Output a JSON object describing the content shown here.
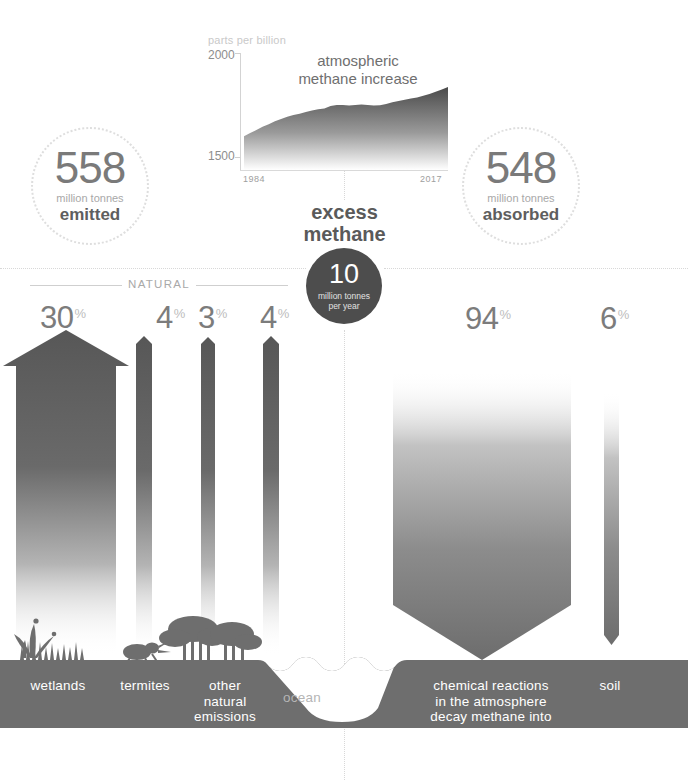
{
  "chart": {
    "units_label": "parts per billion",
    "title": "atmospheric\nmethane increase",
    "title_line1": "atmospheric",
    "title_line2": "methane increase",
    "y_top": "2000",
    "y_bottom": "1500",
    "x_start": "1984",
    "x_end": "2017"
  },
  "chart_data": {
    "type": "area",
    "title": "atmospheric methane increase",
    "xlabel": "",
    "ylabel": "parts per billion",
    "ylim": [
      1500,
      2000
    ],
    "xlim": [
      1984,
      2017
    ],
    "grid": false,
    "legend": "none",
    "x": [
      1984,
      1985,
      1986,
      1987,
      1988,
      1989,
      1990,
      1991,
      1992,
      1993,
      1994,
      1995,
      1996,
      1997,
      1998,
      1999,
      2000,
      2001,
      2002,
      2003,
      2004,
      2005,
      2006,
      2007,
      2008,
      2009,
      2010,
      2011,
      2012,
      2013,
      2014,
      2015,
      2016,
      2017
    ],
    "values": [
      1645,
      1660,
      1672,
      1686,
      1697,
      1710,
      1720,
      1730,
      1737,
      1742,
      1750,
      1757,
      1762,
      1765,
      1776,
      1780,
      1780,
      1778,
      1780,
      1782,
      1780,
      1778,
      1779,
      1784,
      1792,
      1797,
      1803,
      1808,
      1813,
      1820,
      1828,
      1837,
      1847,
      1858
    ]
  },
  "circles": {
    "emitted": {
      "value": "558",
      "unit": "million tonnes",
      "label": "emitted"
    },
    "absorbed": {
      "value": "548",
      "unit": "million tonnes",
      "label": "absorbed"
    }
  },
  "excess": {
    "title_line1": "excess",
    "title_line2": "methane",
    "value": "10",
    "unit_line1": "million tonnes",
    "unit_line2": "per year"
  },
  "natural": {
    "bracket_label": "NATURAL"
  },
  "sources": [
    {
      "key": "wetlands",
      "percent": "30",
      "symbol": "%",
      "label": "wetlands",
      "direction": "emitted"
    },
    {
      "key": "termites",
      "percent": "4",
      "symbol": "%",
      "label": "termites",
      "direction": "emitted"
    },
    {
      "key": "other-natural-emissions",
      "percent": "3",
      "symbol": "%",
      "label": "other\nnatural\nemissions",
      "label_line1": "other",
      "label_line2": "natural",
      "label_line3": "emissions",
      "direction": "emitted"
    },
    {
      "key": "ocean",
      "percent": "4",
      "symbol": "%",
      "label": "ocean",
      "direction": "emitted"
    }
  ],
  "sinks": [
    {
      "key": "chemical-reactions",
      "percent": "94",
      "symbol": "%",
      "label": "chemical reactions\nin the atmosphere\ndecay methane into\nwater & CO2",
      "label_line1": "chemical reactions",
      "label_line2": "in the atmosphere",
      "label_line3": "decay methane into",
      "label_line4": "water & CO2",
      "direction": "absorbed"
    },
    {
      "key": "soil",
      "percent": "6",
      "symbol": "%",
      "label": "soil",
      "direction": "absorbed"
    }
  ],
  "colors": {
    "arrow_dark": "#575757",
    "ground": "#6e6e6e",
    "badge": "#4d4d4d",
    "number_gray": "#7a7a7a",
    "muted": "#a8a8a8",
    "dotted": "#d8d8d8",
    "background": "#ffffff"
  }
}
